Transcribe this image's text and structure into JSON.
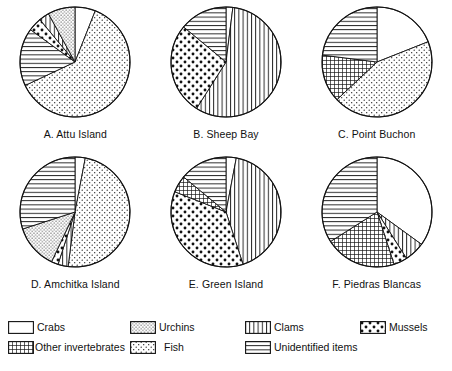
{
  "figure": {
    "title": "",
    "note": ""
  },
  "legend": {
    "items": [
      {
        "key": "crabs",
        "label": "Crabs",
        "pattern": "blank",
        "color": "#ffffff"
      },
      {
        "key": "urchins",
        "label": "Urchins",
        "pattern": "fine-stipple",
        "color": "#ffffff"
      },
      {
        "key": "clams",
        "label": "Clams",
        "pattern": "vertical",
        "color": "#ffffff"
      },
      {
        "key": "mussels",
        "label": "Mussels",
        "pattern": "big-dots",
        "color": "#ffffff"
      },
      {
        "key": "other_invertebrates",
        "label": "Other invertebrates",
        "pattern": "crosshatch",
        "color": "#ffffff"
      },
      {
        "key": "fish",
        "label": "Fish",
        "pattern": "stipple",
        "color": "#ffffff"
      },
      {
        "key": "unidentified",
        "label": "Unidentified items",
        "pattern": "horizontal",
        "color": "#ffffff"
      }
    ]
  },
  "chart_data": [
    {
      "type": "pie",
      "id": "A",
      "title": "A. Attu Island",
      "start_angle_deg": 0,
      "direction": "clockwise",
      "categories": [
        "Crabs",
        "Fish",
        "Unidentified items",
        "Mussels",
        "Clams",
        "Urchins"
      ],
      "values": [
        6,
        62,
        17,
        4,
        3,
        8
      ],
      "slices": [
        {
          "label": "Crabs",
          "pattern": "blank",
          "value": 6
        },
        {
          "label": "Fish",
          "pattern": "stipple",
          "value": 62
        },
        {
          "label": "Unidentified items",
          "pattern": "horizontal",
          "value": 17
        },
        {
          "label": "Mussels",
          "pattern": "big-dots",
          "value": 4
        },
        {
          "label": "Clams",
          "pattern": "vertical",
          "value": 3
        },
        {
          "label": "Urchins",
          "pattern": "fine-stipple",
          "value": 8
        }
      ]
    },
    {
      "type": "pie",
      "id": "B",
      "title": "B. Sheep Bay",
      "start_angle_deg": 0,
      "direction": "clockwise",
      "categories": [
        "Crabs",
        "Clams",
        "Mussels",
        "Unidentified items"
      ],
      "values": [
        2,
        57,
        27,
        14
      ],
      "slices": [
        {
          "label": "Crabs",
          "pattern": "blank",
          "value": 2
        },
        {
          "label": "Clams",
          "pattern": "vertical",
          "value": 57
        },
        {
          "label": "Mussels",
          "pattern": "big-dots",
          "value": 27
        },
        {
          "label": "Unidentified items",
          "pattern": "horizontal",
          "value": 14
        }
      ]
    },
    {
      "type": "pie",
      "id": "C",
      "title": "C. Point Buchon",
      "start_angle_deg": 0,
      "direction": "clockwise",
      "categories": [
        "Crabs",
        "Fish",
        "Other invertebrates",
        "Unidentified items"
      ],
      "values": [
        19,
        44,
        14,
        23
      ],
      "slices": [
        {
          "label": "Crabs",
          "pattern": "blank",
          "value": 19
        },
        {
          "label": "Fish",
          "pattern": "stipple",
          "value": 44
        },
        {
          "label": "Other invertebrates",
          "pattern": "crosshatch",
          "value": 14
        },
        {
          "label": "Unidentified items",
          "pattern": "horizontal",
          "value": 23
        }
      ]
    },
    {
      "type": "pie",
      "id": "D",
      "title": "D. Amchitka Island",
      "start_angle_deg": 0,
      "direction": "clockwise",
      "categories": [
        "Crabs",
        "Fish",
        "Clams",
        "Mussels",
        "Urchins",
        "Unidentified items"
      ],
      "values": [
        3,
        49,
        3,
        2,
        13,
        30
      ],
      "slices": [
        {
          "label": "Crabs",
          "pattern": "blank",
          "value": 3
        },
        {
          "label": "Fish",
          "pattern": "stipple",
          "value": 49
        },
        {
          "label": "Clams",
          "pattern": "vertical",
          "value": 3
        },
        {
          "label": "Mussels",
          "pattern": "big-dots",
          "value": 2
        },
        {
          "label": "Urchins",
          "pattern": "fine-stipple",
          "value": 13
        },
        {
          "label": "Unidentified items",
          "pattern": "horizontal",
          "value": 30
        }
      ]
    },
    {
      "type": "pie",
      "id": "E",
      "title": "E. Green Island",
      "start_angle_deg": 0,
      "direction": "clockwise",
      "categories": [
        "Crabs",
        "Clams",
        "Mussels",
        "Other invertebrates",
        "Unidentified items"
      ],
      "values": [
        3,
        42,
        36,
        5,
        14
      ],
      "slices": [
        {
          "label": "Crabs",
          "pattern": "blank",
          "value": 3
        },
        {
          "label": "Clams",
          "pattern": "vertical",
          "value": 42
        },
        {
          "label": "Mussels",
          "pattern": "big-dots",
          "value": 36
        },
        {
          "label": "Other invertebrates",
          "pattern": "crosshatch",
          "value": 5
        },
        {
          "label": "Unidentified items",
          "pattern": "horizontal",
          "value": 14
        }
      ]
    },
    {
      "type": "pie",
      "id": "F",
      "title": "F. Piedras Blancas",
      "start_angle_deg": 0,
      "direction": "clockwise",
      "categories": [
        "Crabs",
        "Clams",
        "Mussels",
        "Other invertebrates",
        "Unidentified items"
      ],
      "values": [
        35,
        6,
        4,
        21,
        34
      ],
      "slices": [
        {
          "label": "Crabs",
          "pattern": "blank",
          "value": 35
        },
        {
          "label": "Clams",
          "pattern": "vertical",
          "value": 6
        },
        {
          "label": "Mussels",
          "pattern": "big-dots",
          "value": 4
        },
        {
          "label": "Other invertebrates",
          "pattern": "crosshatch",
          "value": 21
        },
        {
          "label": "Unidentified items",
          "pattern": "horizontal",
          "value": 34
        }
      ]
    }
  ]
}
